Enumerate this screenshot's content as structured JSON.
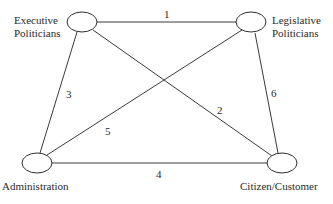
{
  "diagram": {
    "type": "network",
    "nodes": [
      {
        "id": "executive",
        "label_line1": "Executive",
        "label_line2": "Politicians"
      },
      {
        "id": "legislative",
        "label_line1": "Legislative",
        "label_line2": "Politicians"
      },
      {
        "id": "administration",
        "label": "Administration"
      },
      {
        "id": "citizen",
        "label": "Citizen/Customer"
      }
    ],
    "edges": [
      {
        "from": "executive",
        "to": "legislative",
        "label": "1"
      },
      {
        "from": "executive",
        "to": "citizen",
        "label": "2"
      },
      {
        "from": "executive",
        "to": "administration",
        "label": "3"
      },
      {
        "from": "administration",
        "to": "citizen",
        "label": "4"
      },
      {
        "from": "administration",
        "to": "legislative",
        "label": "5"
      },
      {
        "from": "legislative",
        "to": "citizen",
        "label": "6"
      }
    ]
  }
}
